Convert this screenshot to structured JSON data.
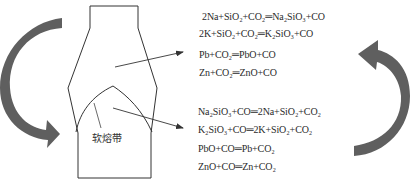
{
  "diagram": {
    "type": "blast-furnace-reaction-diagram",
    "zone_label": "软熔带",
    "colors": {
      "line": "#333333",
      "curved_arrow": "#5f5f5f",
      "text": "#2a2a2a",
      "background": "#ffffff"
    },
    "upper_reactions": [
      {
        "lhs": "2Na+SiO₂+CO₂",
        "rhs": "Na₂SiO₃+CO"
      },
      {
        "lhs": "2K+SiO₂+CO₂",
        "rhs": "K₂SiO₃+CO"
      },
      {
        "lhs": "Pb+CO₂",
        "rhs": "PbO+CO"
      },
      {
        "lhs": "Zn+CO₂",
        "rhs": "ZnO+CO"
      }
    ],
    "lower_reactions": [
      {
        "lhs": "Na₂SiO₃+CO",
        "rhs": "2Na+SiO₂+CO₂"
      },
      {
        "lhs": "K₂SiO₃+CO",
        "rhs": "2K+SiO₂+CO₂"
      },
      {
        "lhs": "PbO+CO",
        "rhs": "Pb+CO₂"
      },
      {
        "lhs": "ZnO+CO",
        "rhs": "Zn+CO₂"
      }
    ],
    "equals_sign": "═",
    "curved_arrows": [
      {
        "position": "left",
        "direction": "clockwise-downward"
      },
      {
        "position": "right",
        "direction": "counterclockwise-upward"
      }
    ]
  }
}
